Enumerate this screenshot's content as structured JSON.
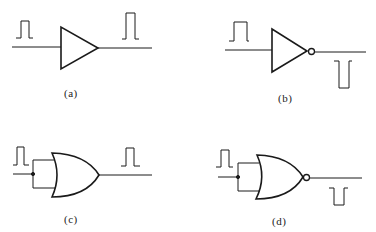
{
  "diagram": {
    "type": "logic-gate-symbols",
    "stroke_color": "#1a1a1a",
    "background": "#ffffff",
    "panels": [
      {
        "id": "a",
        "label": "(a)",
        "gate": "buffer",
        "input_waveform": "positive-pulse",
        "output_waveform": "positive-pulse"
      },
      {
        "id": "b",
        "label": "(b)",
        "gate": "inverter",
        "input_waveform": "positive-pulse",
        "output_waveform": "negative-pulse"
      },
      {
        "id": "c",
        "label": "(c)",
        "gate": "or-with-tied-inputs",
        "input_waveform": "positive-pulse",
        "output_waveform": "positive-pulse"
      },
      {
        "id": "d",
        "label": "(d)",
        "gate": "nor-with-tied-inputs",
        "input_waveform": "positive-pulse",
        "output_waveform": "negative-pulse"
      }
    ]
  }
}
